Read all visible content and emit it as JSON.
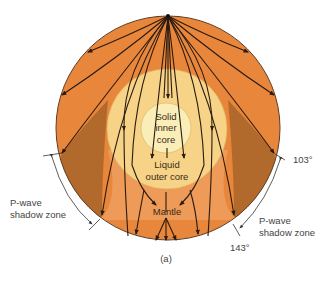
{
  "figure": {
    "caption": "(a)",
    "labels": {
      "inner_core": [
        "Solid",
        "inner",
        "core"
      ],
      "outer_core": [
        "Liquid",
        "outer core"
      ],
      "mantle": "Mantle"
    },
    "shadow_zone_left": [
      "P-wave",
      "shadow zone"
    ],
    "shadow_zone_right": [
      "P-wave",
      "shadow zone"
    ],
    "angle_top": "103°",
    "angle_bottom": "143°"
  },
  "colors": {
    "mantle": "#E8873C",
    "lower_mantle": "#EE9A58",
    "shadow_zone": "#B26A2C",
    "outer_core": "#F6D386",
    "inner_core": "#FAEEB8",
    "ray": "#2a1a10",
    "outline": "#5a3a20"
  }
}
